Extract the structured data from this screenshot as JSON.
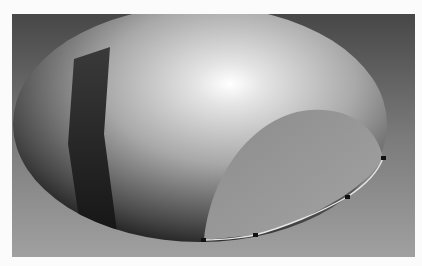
{
  "viewport": {
    "label": "3D model viewport",
    "background_top": "#4a4a4a",
    "background_bottom": "#9a9a9a"
  },
  "model": {
    "type": "shaded shell surface",
    "surface_color": "#b5b5b5",
    "band_color": "#2c2c2c",
    "opening_color": "#9e9e9e",
    "edge_color": "#e8e8e8",
    "vertex_handles": [
      {
        "id": "v1",
        "x": 192,
        "y": 226
      },
      {
        "id": "v2",
        "x": 243,
        "y": 221
      },
      {
        "id": "v3",
        "x": 335,
        "y": 183
      },
      {
        "id": "v4",
        "x": 371,
        "y": 144
      }
    ]
  }
}
